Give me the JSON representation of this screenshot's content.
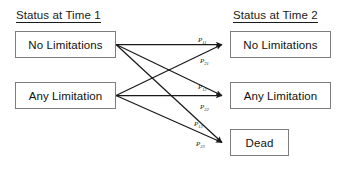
{
  "headers": {
    "left": "Status at Time 1",
    "right": "Status at Time 2"
  },
  "source_states": [
    {
      "id": "no-limitations",
      "label": "No Limitations"
    },
    {
      "id": "any-limitation",
      "label": "Any Limitation"
    }
  ],
  "target_states": [
    {
      "id": "no-limitations",
      "label": "No Limitations"
    },
    {
      "id": "any-limitation",
      "label": "Any Limitation"
    },
    {
      "id": "dead",
      "label": "Dead"
    }
  ],
  "transitions": [
    {
      "id": "p11",
      "base": "P",
      "sub": "11",
      "from": "No Limitations",
      "to": "No Limitations"
    },
    {
      "id": "p21",
      "base": "P",
      "sub": "21",
      "from": "Any Limitation",
      "to": "No Limitations"
    },
    {
      "id": "p12",
      "base": "P",
      "sub": "12",
      "from": "No Limitations",
      "to": "Any Limitation"
    },
    {
      "id": "p22",
      "base": "P",
      "sub": "22",
      "from": "Any Limitation",
      "to": "Any Limitation"
    },
    {
      "id": "p13",
      "base": "P",
      "sub": "13",
      "from": "No Limitations",
      "to": "Dead"
    },
    {
      "id": "p23",
      "base": "P",
      "sub": "23",
      "from": "Any Limitation",
      "to": "Dead"
    }
  ],
  "colors": {
    "box_border": "#7d7d7d",
    "text": "#111111",
    "arrow": "#1a1a1a",
    "background": "#ffffff"
  }
}
